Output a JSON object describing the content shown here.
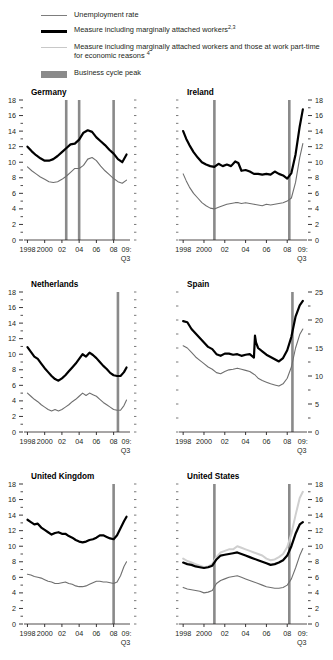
{
  "legend": {
    "items": [
      {
        "key": "unemployment-rate",
        "style": "line-thin",
        "color": "#7d7d7d",
        "label": "Unemployment rate",
        "sup": ""
      },
      {
        "key": "marginally-attached",
        "style": "line-thick",
        "color": "#000000",
        "label": "Measure including marginally attached workers",
        "sup": "2,3"
      },
      {
        "key": "marginally-attached-plus-parttime",
        "style": "line-light",
        "color": "#c8c8c8",
        "label": "Measure including marginally attached workers and those at work part-time for economic reasons ",
        "sup": "4"
      },
      {
        "key": "business-cycle-peak",
        "style": "block",
        "color": "#8a8a8a",
        "label": "Business cycle peak",
        "sup": ""
      }
    ]
  },
  "axis": {
    "x_tick_labels": [
      "1998",
      "2000",
      "02",
      "04",
      "06",
      "08",
      "09:"
    ],
    "x_tick_values": [
      1998,
      2000,
      2002,
      2004,
      2006,
      2008,
      2009.5
    ],
    "x_sub_label": "Q3",
    "x_min": 1997.6,
    "x_max": 2009.9
  },
  "colors": {
    "series_unemployment": "#6f6f6f",
    "series_marginal": "#000000",
    "series_parttime": "#cfcfcf",
    "peak_line": "#8a8a8a",
    "axis": "#231f20"
  },
  "chart_data": [
    {
      "type": "line",
      "title": "Germany",
      "panel": "germany",
      "axis_side": "left",
      "xlabel": "",
      "ylabel": "",
      "ylim": [
        0,
        18
      ],
      "y_ticks": [
        0,
        2,
        4,
        6,
        8,
        10,
        12,
        14,
        16,
        18
      ],
      "y_minor_step": 1,
      "grid": false,
      "legend_position": "top",
      "business_cycle_peaks": [
        2002.5,
        2004.0,
        2008.0
      ],
      "x": [
        1998.0,
        1998.5,
        1999.0,
        1999.5,
        2000.0,
        2000.5,
        2001.0,
        2001.5,
        2002.0,
        2002.5,
        2003.0,
        2003.5,
        2004.0,
        2004.5,
        2005.0,
        2005.5,
        2006.0,
        2006.5,
        2007.0,
        2007.5,
        2008.0,
        2008.5,
        2009.0,
        2009.5
      ],
      "series": [
        {
          "name": "Measure including marginally attached workers",
          "color": "#000000",
          "width": 2.2,
          "values": [
            12.0,
            11.4,
            10.9,
            10.5,
            10.2,
            10.2,
            10.4,
            10.8,
            11.3,
            11.8,
            12.3,
            12.4,
            12.9,
            13.8,
            14.1,
            13.9,
            13.2,
            12.7,
            12.2,
            11.6,
            11.1,
            10.4,
            10.0,
            11.0
          ]
        },
        {
          "name": "Unemployment rate",
          "color": "#6f6f6f",
          "width": 1.1,
          "values": [
            9.4,
            8.9,
            8.5,
            8.1,
            7.8,
            7.5,
            7.4,
            7.5,
            7.8,
            8.2,
            8.7,
            9.2,
            9.2,
            9.6,
            10.4,
            10.6,
            10.2,
            9.5,
            8.9,
            8.4,
            7.9,
            7.5,
            7.3,
            7.7
          ]
        }
      ]
    },
    {
      "type": "line",
      "title": "Ireland",
      "panel": "ireland",
      "axis_side": "right",
      "xlabel": "",
      "ylabel": "",
      "ylim": [
        0,
        18
      ],
      "y_ticks": [
        0,
        2,
        4,
        6,
        8,
        10,
        12,
        14,
        16,
        18
      ],
      "y_minor_step": 1,
      "grid": false,
      "legend_position": "top",
      "business_cycle_peaks": [
        2001.0,
        2008.2
      ],
      "x": [
        1998.0,
        1998.3,
        1998.6,
        1999.0,
        1999.4,
        1999.8,
        2000.2,
        2000.6,
        2001.0,
        2001.4,
        2001.8,
        2002.2,
        2002.6,
        2003.0,
        2003.3,
        2003.6,
        2004.0,
        2004.4,
        2004.8,
        2005.2,
        2005.6,
        2006.0,
        2006.4,
        2006.8,
        2007.2,
        2007.6,
        2008.0,
        2008.4,
        2008.8,
        2009.2,
        2009.5
      ],
      "series": [
        {
          "name": "Measure including marginally attached workers",
          "color": "#000000",
          "width": 2.2,
          "values": [
            14.0,
            13.0,
            12.2,
            11.3,
            10.6,
            10.0,
            9.7,
            9.5,
            9.4,
            9.8,
            9.5,
            9.7,
            9.5,
            10.1,
            9.9,
            8.9,
            9.0,
            8.8,
            8.5,
            8.5,
            8.4,
            8.5,
            8.4,
            8.8,
            8.5,
            8.3,
            7.9,
            8.6,
            11.0,
            14.6,
            16.8
          ]
        },
        {
          "name": "Unemployment rate",
          "color": "#6f6f6f",
          "width": 1.1,
          "values": [
            8.5,
            7.6,
            6.8,
            6.0,
            5.4,
            4.8,
            4.4,
            4.1,
            4.0,
            4.2,
            4.4,
            4.6,
            4.7,
            4.8,
            4.8,
            4.7,
            4.8,
            4.7,
            4.6,
            4.5,
            4.4,
            4.6,
            4.5,
            4.6,
            4.7,
            4.8,
            5.0,
            5.4,
            7.4,
            10.6,
            12.4
          ]
        }
      ]
    },
    {
      "type": "line",
      "title": "Netherlands",
      "panel": "netherlands",
      "axis_side": "left",
      "xlabel": "",
      "ylabel": "",
      "ylim": [
        0,
        18
      ],
      "y_ticks": [
        0,
        2,
        4,
        6,
        8,
        10,
        12,
        14,
        16,
        18
      ],
      "y_minor_step": 1,
      "grid": false,
      "legend_position": "top",
      "business_cycle_peaks": [
        2008.5
      ],
      "x": [
        1998.0,
        1998.4,
        1998.8,
        1999.2,
        1999.6,
        2000.0,
        2000.4,
        2000.8,
        2001.2,
        2001.6,
        2002.0,
        2002.4,
        2002.8,
        2003.2,
        2003.6,
        2004.0,
        2004.4,
        2004.8,
        2005.2,
        2005.6,
        2006.0,
        2006.4,
        2006.8,
        2007.2,
        2007.6,
        2008.0,
        2008.4,
        2008.8,
        2009.2,
        2009.5
      ],
      "series": [
        {
          "name": "Measure including marginally attached workers",
          "color": "#000000",
          "width": 2.2,
          "values": [
            10.9,
            10.3,
            9.7,
            9.4,
            8.8,
            8.2,
            7.7,
            7.2,
            6.8,
            6.6,
            6.9,
            7.3,
            7.8,
            8.3,
            8.8,
            9.4,
            10.0,
            9.7,
            10.2,
            9.9,
            9.5,
            9.0,
            8.5,
            8.1,
            7.6,
            7.3,
            7.2,
            7.2,
            7.7,
            8.3
          ]
        },
        {
          "name": "Unemployment rate",
          "color": "#6f6f6f",
          "width": 1.1,
          "values": [
            5.0,
            4.6,
            4.2,
            3.9,
            3.5,
            3.2,
            2.9,
            2.7,
            2.9,
            2.7,
            2.9,
            3.2,
            3.5,
            3.9,
            4.2,
            4.6,
            5.0,
            4.7,
            5.0,
            4.8,
            4.6,
            4.2,
            3.8,
            3.5,
            3.2,
            2.9,
            2.8,
            2.8,
            3.4,
            4.1
          ]
        }
      ]
    },
    {
      "type": "line",
      "title": "Spain",
      "panel": "spain",
      "axis_side": "right",
      "xlabel": "",
      "ylabel": "",
      "ylim": [
        0,
        25
      ],
      "y_ticks": [
        0,
        5,
        10,
        15,
        20,
        25
      ],
      "y_minor_step": 2.5,
      "grid": false,
      "legend_position": "top",
      "business_cycle_peaks": [
        2008.5
      ],
      "x": [
        1998.0,
        1998.4,
        1998.8,
        1999.2,
        1999.6,
        2000.0,
        2000.4,
        2000.8,
        2001.2,
        2001.6,
        2002.0,
        2002.4,
        2002.8,
        2003.2,
        2003.6,
        2004.0,
        2004.4,
        2004.8,
        2004.9,
        2005.0,
        2005.2,
        2005.6,
        2006.0,
        2006.4,
        2006.8,
        2007.2,
        2007.6,
        2008.0,
        2008.4,
        2008.8,
        2009.2,
        2009.5
      ],
      "series": [
        {
          "name": "Measure including marginally attached workers",
          "color": "#000000",
          "width": 2.2,
          "values": [
            19.8,
            19.6,
            18.4,
            17.6,
            16.8,
            16.0,
            15.2,
            14.8,
            13.9,
            13.6,
            14.0,
            14.0,
            13.8,
            13.9,
            13.6,
            13.8,
            13.9,
            13.3,
            17.2,
            16.0,
            15.0,
            14.4,
            13.8,
            13.4,
            13.0,
            12.6,
            13.2,
            14.6,
            17.0,
            20.6,
            22.6,
            23.4
          ]
        },
        {
          "name": "Unemployment rate",
          "color": "#6f6f6f",
          "width": 1.1,
          "values": [
            15.4,
            15.0,
            14.2,
            13.4,
            12.8,
            12.2,
            11.6,
            11.2,
            10.6,
            10.4,
            10.8,
            11.1,
            11.2,
            11.4,
            11.2,
            11.0,
            10.8,
            10.3,
            10.2,
            10.0,
            9.6,
            9.2,
            8.9,
            8.6,
            8.4,
            8.2,
            8.6,
            9.6,
            11.6,
            15.0,
            17.4,
            18.4
          ]
        }
      ]
    },
    {
      "type": "line",
      "title": "United Kingdom",
      "panel": "united-kingdom",
      "axis_side": "left",
      "xlabel": "",
      "ylabel": "",
      "ylim": [
        0,
        18
      ],
      "y_ticks": [
        0,
        2,
        4,
        6,
        8,
        10,
        12,
        14,
        16,
        18
      ],
      "y_minor_step": 1,
      "grid": false,
      "legend_position": "top",
      "business_cycle_peaks": [
        2008.0
      ],
      "x": [
        1998.0,
        1998.4,
        1998.8,
        1999.2,
        1999.6,
        2000.0,
        2000.4,
        2000.8,
        2001.2,
        2001.6,
        2002.0,
        2002.4,
        2002.8,
        2003.2,
        2003.6,
        2004.0,
        2004.4,
        2004.8,
        2005.2,
        2005.6,
        2006.0,
        2006.4,
        2006.8,
        2007.2,
        2007.6,
        2008.0,
        2008.4,
        2008.8,
        2009.2,
        2009.5
      ],
      "series": [
        {
          "name": "Measure including marginally attached workers",
          "color": "#000000",
          "width": 2.2,
          "values": [
            13.4,
            13.1,
            12.8,
            12.9,
            12.4,
            12.1,
            11.8,
            11.5,
            11.7,
            11.8,
            11.6,
            11.6,
            11.3,
            11.1,
            10.8,
            10.6,
            10.5,
            10.6,
            10.8,
            10.9,
            11.1,
            11.4,
            11.4,
            11.2,
            11.0,
            10.9,
            11.4,
            12.3,
            13.2,
            13.8
          ]
        },
        {
          "name": "Unemployment rate",
          "color": "#6f6f6f",
          "width": 1.1,
          "values": [
            6.4,
            6.3,
            6.1,
            6.0,
            5.9,
            5.7,
            5.5,
            5.4,
            5.2,
            5.2,
            5.3,
            5.4,
            5.2,
            5.1,
            4.9,
            4.8,
            4.8,
            4.9,
            5.1,
            5.3,
            5.5,
            5.5,
            5.4,
            5.4,
            5.3,
            5.2,
            5.4,
            6.2,
            7.4,
            8.0
          ]
        }
      ]
    },
    {
      "type": "line",
      "title": "United States",
      "panel": "united-states",
      "axis_side": "right",
      "xlabel": "",
      "ylabel": "",
      "ylim": [
        0,
        18
      ],
      "y_ticks": [
        0,
        2,
        4,
        6,
        8,
        10,
        12,
        14,
        16,
        18
      ],
      "y_minor_step": 1,
      "grid": false,
      "legend_position": "top",
      "business_cycle_peaks": [
        2001.0,
        2008.2
      ],
      "x": [
        1998.0,
        1998.4,
        1998.8,
        1999.2,
        1999.6,
        2000.0,
        2000.4,
        2000.8,
        2001.2,
        2001.6,
        2002.0,
        2002.4,
        2002.8,
        2003.2,
        2003.6,
        2004.0,
        2004.4,
        2004.8,
        2005.2,
        2005.6,
        2006.0,
        2006.4,
        2006.8,
        2007.2,
        2007.6,
        2008.0,
        2008.4,
        2008.8,
        2009.2,
        2009.5
      ],
      "series": [
        {
          "name": "Measure including marginally attached workers and those at work part-time for economic reasons",
          "color": "#cfcfcf",
          "width": 2.0,
          "values": [
            8.4,
            8.1,
            7.9,
            7.7,
            7.5,
            7.3,
            7.4,
            7.7,
            8.6,
            9.2,
            9.4,
            9.6,
            9.6,
            10.0,
            9.8,
            9.6,
            9.4,
            9.2,
            9.0,
            8.8,
            8.4,
            8.2,
            8.3,
            8.6,
            9.0,
            9.9,
            11.6,
            14.0,
            16.2,
            17.0
          ]
        },
        {
          "name": "Measure including marginally attached workers",
          "color": "#000000",
          "width": 2.2,
          "values": [
            7.9,
            7.7,
            7.6,
            7.4,
            7.3,
            7.2,
            7.3,
            7.5,
            8.3,
            8.8,
            8.9,
            9.0,
            9.1,
            9.2,
            9.0,
            8.8,
            8.6,
            8.4,
            8.2,
            8.0,
            7.8,
            7.6,
            7.7,
            7.9,
            8.2,
            8.8,
            10.0,
            11.6,
            12.8,
            13.1
          ]
        },
        {
          "name": "Unemployment rate",
          "color": "#6f6f6f",
          "width": 1.1,
          "values": [
            4.7,
            4.5,
            4.4,
            4.3,
            4.2,
            4.0,
            4.1,
            4.3,
            5.2,
            5.6,
            5.8,
            6.0,
            6.1,
            6.2,
            6.0,
            5.8,
            5.6,
            5.4,
            5.2,
            5.0,
            4.8,
            4.7,
            4.6,
            4.6,
            4.7,
            5.0,
            5.8,
            7.2,
            8.8,
            9.7
          ]
        }
      ]
    }
  ]
}
